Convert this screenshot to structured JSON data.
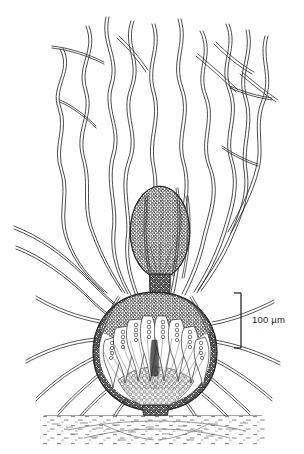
{
  "figure": {
    "kind": "scientific-line-drawing",
    "background_color": "#ffffff",
    "ink_color": "#1a1a1a",
    "caption": ""
  },
  "scale_bar": {
    "label": "100 µm",
    "value": 100,
    "unit": "µm",
    "orientation": "vertical",
    "bar_length_px": 55,
    "x_px": 241,
    "y_top_px": 293,
    "y_bottom_px": 348,
    "serif_direction": "left"
  },
  "parts": {
    "spore_mass": {
      "name": "spore-mass",
      "cx": 160,
      "cy": 232,
      "rx": 30,
      "ry": 46
    },
    "neck": {
      "name": "sporangium-neck",
      "x": 157,
      "y_top": 276,
      "y_bottom": 300
    },
    "sporangium_body": {
      "name": "sporangium-body",
      "cx": 155,
      "cy": 352,
      "rx": 62,
      "ry": 60
    },
    "substrate_line": {
      "name": "substrate-line",
      "y": 416,
      "x_start": 44,
      "x_end": 262
    },
    "holdfast": {
      "name": "basal-holdfast",
      "cx": 155,
      "cy": 412
    }
  },
  "counts": {
    "upper_filaments": 14,
    "radiating_rhizoids": 16,
    "internal_asci": 13
  },
  "colors": {
    "ink": "#1a1a1a",
    "mid_gray": "#555555",
    "light_gray": "#9a9a9a",
    "paper": "#ffffff"
  }
}
